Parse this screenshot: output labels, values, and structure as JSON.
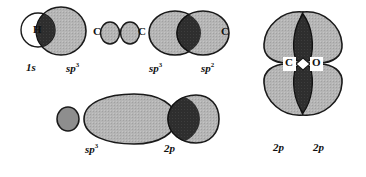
{
  "figure": {
    "type": "diagram",
    "background_color": "#ffffff",
    "colors": {
      "lobe_fill": "#b3b3b3",
      "overlap_fill": "#2b2b2b",
      "outline": "#1a1a1a",
      "empty_fill": "#ffffff",
      "text": "#111111"
    }
  },
  "structures": [
    {
      "id": "h-sp3-sigma",
      "name": "H 1s with carbon sp3 sigma overlap",
      "atom_labels": [
        {
          "text": "H",
          "x": 40,
          "y": 30
        }
      ],
      "orbital_labels": [
        {
          "text": "1",
          "sup": "",
          "italic_tail": "s",
          "x": 31,
          "y": 70
        },
        {
          "text": "sp",
          "sup": "3",
          "x": 72,
          "y": 70
        }
      ]
    },
    {
      "id": "sp3-small-lobe",
      "name": "carbon sp3 small back lobe",
      "atom_labels": [
        {
          "text": "C",
          "x": 95,
          "y": 33
        },
        {
          "text": "C",
          "x": 139,
          "y": 33
        }
      ],
      "orbital_labels": []
    },
    {
      "id": "sp3-sp2-sigma",
      "name": "sp3 sp2 sigma overlap between two carbons",
      "atom_labels": [
        {
          "text": "C",
          "x": 222,
          "y": 33
        }
      ],
      "orbital_labels": [
        {
          "text": "sp",
          "sup": "3",
          "x": 153,
          "y": 70
        },
        {
          "text": "sp",
          "sup": "2",
          "x": 205,
          "y": 70
        }
      ]
    },
    {
      "id": "sp3-2p-sigma",
      "name": "sp3 with 2p sigma overlap lower row",
      "atom_labels": [],
      "orbital_labels": [
        {
          "text": "sp",
          "sup": "3",
          "x": 89,
          "y": 150
        },
        {
          "text": "2",
          "sup": "",
          "italic_tail": "p",
          "x": 167,
          "y": 150
        }
      ]
    },
    {
      "id": "co-pi-bond",
      "name": "carbon oxygen 2p pi bond overlap",
      "atom_labels": [
        {
          "text": "C",
          "x": 288,
          "y": 60
        },
        {
          "text": "O",
          "x": 320,
          "y": 60
        }
      ],
      "orbital_labels": [
        {
          "text": "2",
          "sup": "",
          "italic_tail": "p",
          "x": 277,
          "y": 149
        },
        {
          "text": "2",
          "sup": "",
          "italic_tail": "p",
          "x": 317,
          "y": 149
        }
      ]
    }
  ],
  "all_text": [
    "H",
    "1s",
    "sp3",
    "C",
    "C",
    "sp3",
    "sp2",
    "C",
    "sp3",
    "2p",
    "C",
    "O",
    "2p",
    "2p"
  ]
}
